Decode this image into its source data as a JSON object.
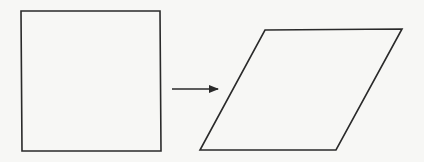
{
  "diagram": {
    "description": "Square transformed (sheared) into a parallelogram",
    "background_color": "#f7f7f5",
    "stroke_color": "#2a2a2a",
    "shapes": [
      {
        "id": "square",
        "type": "polygon",
        "label": "square",
        "points": [
          [
            21,
            11
          ],
          [
            160,
            11
          ],
          [
            161,
            151
          ],
          [
            22,
            151
          ]
        ]
      },
      {
        "id": "parallelogram",
        "type": "polygon",
        "label": "parallelogram",
        "points": [
          [
            265,
            30
          ],
          [
            402,
            29
          ],
          [
            336,
            150
          ],
          [
            200,
            150
          ]
        ]
      }
    ],
    "connectors": [
      {
        "id": "transform-arrow",
        "type": "arrow",
        "from": [
          172,
          89
        ],
        "to": [
          218,
          89
        ]
      }
    ]
  }
}
